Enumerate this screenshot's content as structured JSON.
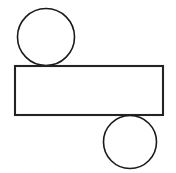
{
  "canvas": {
    "width": 176,
    "height": 173,
    "background_color": "#ffffff",
    "title": "Geometric Figure"
  },
  "style": {
    "stroke_color": "#1c1c1c",
    "circle_stroke_color": "#1a1a1a",
    "rect_stroke_color": "#232323",
    "fill_color": "none",
    "rect_stroke_width": 2.1,
    "circle_stroke_width": 1.6
  },
  "shapes": [
    {
      "id": "top-circle",
      "type": "circle",
      "label": "Top Circle",
      "cx": 46,
      "cy": 37,
      "r": 28.5,
      "fill": "none",
      "stroke": "#1a1a1a",
      "stroke_width": 1.6,
      "relation": "tangent to rectangle top edge"
    },
    {
      "id": "main-rectangle",
      "type": "rect",
      "label": "Rectangle",
      "x": 15,
      "y": 66,
      "width": 148,
      "height": 49,
      "fill": "none",
      "stroke": "#232323",
      "stroke_width": 2.1,
      "relation": "horizontal bar spanning canvas"
    },
    {
      "id": "bottom-circle",
      "type": "circle",
      "label": "Bottom Circle",
      "cx": 130,
      "cy": 142,
      "r": 26.5,
      "fill": "none",
      "stroke": "#1a1a1a",
      "stroke_width": 1.6,
      "relation": "tangent to rectangle bottom edge"
    }
  ]
}
